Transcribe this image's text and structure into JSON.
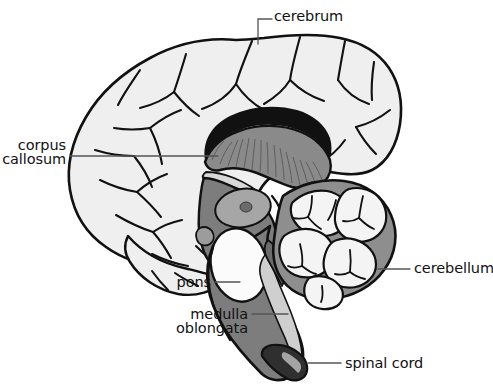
{
  "figure": {
    "background_color": "#ffffff",
    "width": 493,
    "height": 389
  },
  "palette": {
    "outline": "#111111",
    "cerebrum_fill": "#efefef",
    "cerebellum_lobule_fill": "#f4f4f4",
    "cerebellum_cortex_fill": "#8e8e8e",
    "corpus_callosum_fill": "#8a8a8a",
    "brainstem_fill": "#7d7d7d",
    "thalamus_fill": "#9a9a9a",
    "pons_fill": "#fbfbfb",
    "spinal_cord_fill": "#cfcfcf",
    "leader_line": "#555555",
    "text": "#111111"
  },
  "labels": [
    {
      "id": "cerebrum",
      "name": "cerebrum",
      "text": "cerebrum",
      "align": "left",
      "x": 274,
      "y": 9,
      "leader": {
        "type": "elbow",
        "points": "258,44 258,19 272,19"
      }
    },
    {
      "id": "corpus-callosum",
      "name": "corpus callosum",
      "text": "corpus\ncallosum",
      "lines": [
        "corpus",
        "callosum"
      ],
      "align": "right",
      "x": 10,
      "y": 138,
      "leader": {
        "type": "straight",
        "points": "70,156 218,156"
      }
    },
    {
      "id": "cerebellum",
      "name": "cerebellum",
      "text": "cerebellum",
      "align": "left",
      "x": 414,
      "y": 261,
      "leader": {
        "type": "straight",
        "points": "378,269 410,269"
      }
    },
    {
      "id": "pons",
      "name": "pons",
      "text": "pons",
      "align": "right",
      "x": 150,
      "y": 275,
      "leader": {
        "type": "straight",
        "points": "215,282 240,282"
      }
    },
    {
      "id": "medulla-oblongata",
      "name": "medulla oblongata",
      "text": "medulla\noblongata",
      "lines": [
        "medulla",
        "oblongata"
      ],
      "align": "right",
      "x": 150,
      "y": 307,
      "leader": {
        "type": "straight",
        "points": "252,314 288,314"
      }
    },
    {
      "id": "spinal-cord",
      "name": "spinal cord",
      "text": "spinal cord",
      "align": "left",
      "x": 345,
      "y": 356,
      "leader": {
        "type": "straight",
        "points": "308,363 341,363"
      }
    }
  ]
}
